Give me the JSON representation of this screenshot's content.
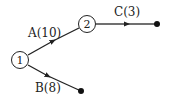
{
  "diagram": {
    "type": "activity-network",
    "nodes": [
      {
        "id": "1",
        "label": "1"
      },
      {
        "id": "2",
        "label": "2"
      }
    ],
    "activities": [
      {
        "name": "A",
        "duration": 10,
        "label": "A(10)",
        "from": "1",
        "to": "2"
      },
      {
        "name": "B",
        "duration": 8,
        "label": "B(8)",
        "from": "1",
        "to": "end-b"
      },
      {
        "name": "C",
        "duration": 3,
        "label": "C(3)",
        "from": "2",
        "to": "end-c"
      }
    ],
    "colors": {
      "stroke": "#222222",
      "background": "#ffffff"
    }
  }
}
